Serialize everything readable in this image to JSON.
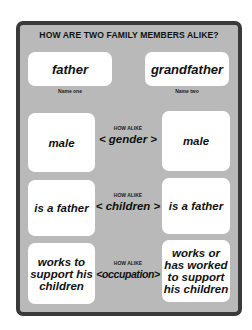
{
  "title": "HOW ARE TWO FAMILY MEMBERS ALIKE?",
  "names": [
    {
      "value": "father",
      "caption": "Name one"
    },
    {
      "value": "grandfather",
      "caption": "Name two"
    }
  ],
  "rows": [
    {
      "how_alike_label": "HOW ALIKE",
      "trait": "< gender >",
      "left": "male",
      "right": "male"
    },
    {
      "how_alike_label": "HOW ALIKE",
      "trait": "< children >",
      "left": "is a father",
      "right": "is a father"
    },
    {
      "how_alike_label": "HOW ALIKE",
      "trait": "<occupation>",
      "left": "works to support his children",
      "right": "works or has worked to support his children"
    }
  ],
  "colors": {
    "panel_bg": "#b9b9b9",
    "border": "#3a3a3a",
    "box_bg": "#ffffff"
  }
}
